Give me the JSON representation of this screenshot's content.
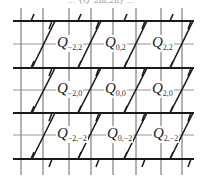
{
  "caption": "… {Q_2m,2n} …",
  "labels": [
    {
      "id": "Q-2,2",
      "letter": "Q",
      "sub": "−2,2",
      "x": 56,
      "y": 36
    },
    {
      "id": "Q0,2",
      "letter": "Q",
      "sub": "0,2",
      "x": 104,
      "y": 36
    },
    {
      "id": "Q2,2",
      "letter": "Q",
      "sub": "2,2",
      "x": 151,
      "y": 36
    },
    {
      "id": "Q-2,0",
      "letter": "Q",
      "sub": "−2,0",
      "x": 56,
      "y": 82
    },
    {
      "id": "Q0,0",
      "letter": "Q",
      "sub": "0,0",
      "x": 104,
      "y": 82
    },
    {
      "id": "Q2,0",
      "letter": "Q",
      "sub": "2,0",
      "x": 151,
      "y": 82
    },
    {
      "id": "Q-2,-2",
      "letter": "Q",
      "sub": "−2,−2",
      "x": 56,
      "y": 127
    },
    {
      "id": "Q0,-2",
      "letter": "Q",
      "sub": "0,−2",
      "x": 106,
      "y": 127
    },
    {
      "id": "Q2,-2",
      "letter": "Q",
      "sub": "2,−2",
      "x": 152,
      "y": 127
    }
  ],
  "grid": {
    "thick_rows_y": [
      21,
      68,
      113,
      159
    ],
    "thin_rows_y": [
      44,
      90,
      135
    ],
    "columns_x": [
      21,
      43,
      69,
      91,
      113,
      136,
      161,
      182
    ],
    "line_color": "#1a1a1a",
    "thin_color": "#8a8a8a"
  }
}
